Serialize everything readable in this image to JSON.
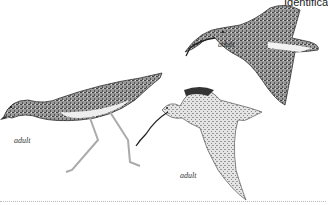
{
  "page": {
    "header_text": "Identifica",
    "figures": [
      {
        "id": "standing-bird",
        "caption": "adult"
      },
      {
        "id": "flying-bird-upper-right",
        "caption": "adult"
      },
      {
        "id": "flying-bird-center",
        "caption": "adult"
      }
    ]
  },
  "colors": {
    "background": "#ffffff",
    "plumage_dark": "#3a3a3a",
    "plumage_mid": "#8a8a8a",
    "plumage_light": "#d8d8d8"
  }
}
